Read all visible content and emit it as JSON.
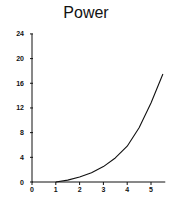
{
  "chart_data": {
    "type": "line",
    "title": "Power",
    "xlabel": "",
    "ylabel": "",
    "xlim": [
      0,
      5.6
    ],
    "ylim": [
      0,
      24
    ],
    "x_ticks": [
      0,
      1,
      2,
      3,
      4,
      5
    ],
    "y_ticks": [
      0,
      4,
      8,
      12,
      16,
      20,
      24
    ],
    "grid": false,
    "legend": null,
    "series": [
      {
        "name": "Power",
        "x": [
          1.0,
          1.5,
          2.0,
          2.5,
          3.0,
          3.5,
          4.0,
          4.5,
          5.0,
          5.5
        ],
        "values": [
          0.0,
          0.3,
          0.8,
          1.5,
          2.5,
          3.9,
          5.8,
          8.8,
          12.8,
          17.5
        ]
      }
    ]
  }
}
